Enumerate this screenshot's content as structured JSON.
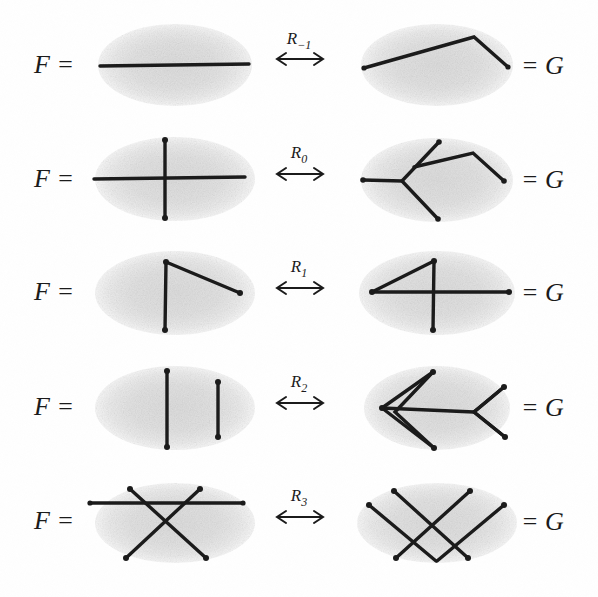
{
  "figure": {
    "left_label": "F =",
    "right_label": "= G",
    "arrow_glyph": "↔",
    "colors": {
      "background": "#ffffff",
      "ink": "#1b1b1b",
      "blob": "#e3e3e3",
      "blob_edge": "#ededed"
    },
    "rows": [
      {
        "id": "row-r-minus-1",
        "move_label": "R",
        "move_sub": "−1",
        "move_full": "R−1",
        "left_name": "single-horizontal-chord",
        "right_name": "bent-chord-two-segments",
        "left_description": "one straight horizontal chord across the blob",
        "right_description": "a chord bent upward into two segments with a kink outside the top of the blob"
      },
      {
        "id": "row-r-0",
        "move_label": "R",
        "move_sub": "0",
        "move_full": "R0",
        "left_name": "horizontal-chord-crossing-vertical-chord",
        "right_name": "star-vertex-with-bent-chord",
        "left_description": "a horizontal chord crossed by a vertical chord",
        "right_description": "three chords meeting at a left vertex plus a bent chord to the right"
      },
      {
        "id": "row-r-1",
        "move_label": "R",
        "move_sub": "1",
        "move_full": "R1",
        "left_name": "vertical-chord-with-diagonal",
        "right_name": "triangle-with-horizontal-chord",
        "left_description": "a vertical chord with a diagonal chord leaving its top end",
        "right_description": "a triangle formed by a horizontal chord, a vertical chord and a diagonal"
      },
      {
        "id": "row-r-2",
        "move_label": "R",
        "move_sub": "2",
        "move_full": "R2",
        "left_name": "two-parallel-vertical-chords",
        "right_name": "two-crossing-bent-chords",
        "left_description": "two disjoint parallel vertical chords",
        "right_description": "two V-bent chords that cross each other twice"
      },
      {
        "id": "row-r-3",
        "move_label": "R",
        "move_sub": "3",
        "move_full": "R3",
        "left_name": "horizontal-chord-over-crossing-pair",
        "right_name": "three-chords-triple-crossing",
        "left_description": "a horizontal chord passing above a pair of crossing diagonals",
        "right_description": "three chords arranged so the crossing pattern is pushed to the other side"
      }
    ]
  }
}
